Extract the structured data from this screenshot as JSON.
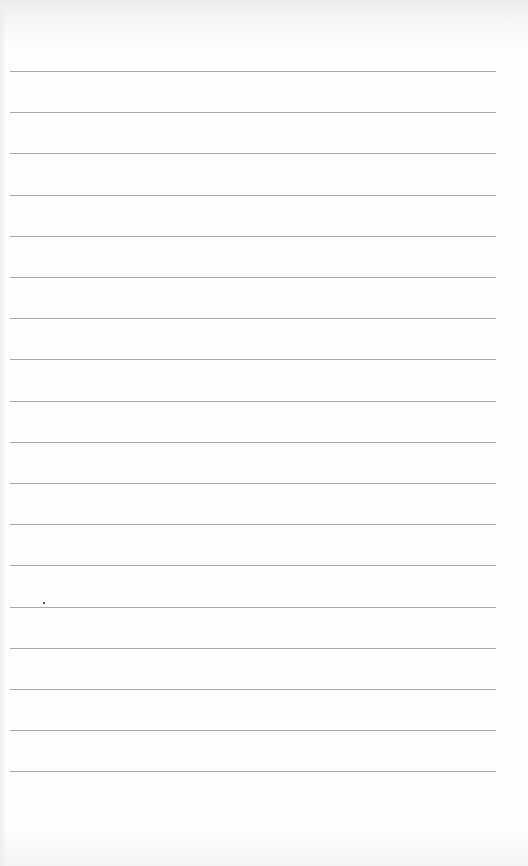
{
  "page": {
    "type": "blank ruled notebook paper",
    "background_color": "#fdfdfd",
    "rule_color": "#a9a9a9",
    "rule_count": 18,
    "rule_start_y": 71,
    "rule_spacing": 41.2,
    "rule_left": 10,
    "rule_width": 486
  },
  "marks": [
    {
      "type": "speck",
      "x": 43,
      "y": 602
    }
  ]
}
